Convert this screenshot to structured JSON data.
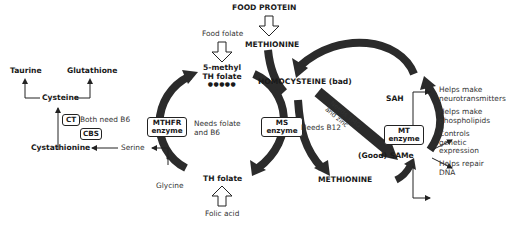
{
  "top": {
    "food_protein": "FOOD PROTEIN",
    "methionine_top": "METHIONINE",
    "food_folate": "Food folate",
    "five_methyl_line1": "5-methyl",
    "five_methyl_line2": "TH folate",
    "dots": "●●●●●"
  },
  "center": {
    "homocysteine": "HOMOCYSTEINE (bad)",
    "ms_enzyme_line1": "MS",
    "ms_enzyme_line2": "enzyme",
    "needs_b12": "Needs B12",
    "methionine_bottom": "METHIONINE",
    "needs_tmg": "Needs TMG",
    "and_zinc": "and zinc"
  },
  "left_cycle": {
    "mthfr_line1": "MTHFR",
    "mthfr_line2": "enzyme",
    "needs_folate_line1": "Needs folate",
    "needs_folate_line2": "and B6",
    "th_folate": "TH folate",
    "folic_acid": "Folic acid",
    "glycine": "Glycine",
    "serine": "Serine"
  },
  "transsulfuration": {
    "taurine": "Taurine",
    "glutathione": "Glutathione",
    "cysteine": "Cysteine",
    "ct": "CT",
    "cbs": "CBS",
    "both_need_b6": "Both need B6",
    "cystathionine": "Cystathionine"
  },
  "right_cycle": {
    "sah": "SAH",
    "same": "(Good) SAMe",
    "mt_line1": "MT",
    "mt_line2": "enzyme"
  },
  "outputs": [
    {
      "line1": "Helps make",
      "line2": "neurotransmitters"
    },
    {
      "line1": "Helps make",
      "line2": "phospholipids"
    },
    {
      "line1": "Controls",
      "line2": "genetic",
      "line3": "expression"
    },
    {
      "line1": "Helps repair",
      "line2": "DNA"
    }
  ],
  "colors": {
    "arrow": "#2b2b2b",
    "text": "#1a1a1a",
    "background": "#ffffff"
  }
}
